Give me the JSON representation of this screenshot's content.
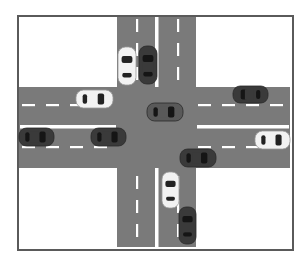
{
  "diagram": {
    "colors": {
      "road": "#7a7a7a",
      "lane_marking": "#ffffff",
      "frame": "#5a5a5a",
      "background": "#ffffff",
      "car_white": "#f2f2f2",
      "car_dark": "#3a3a3a",
      "car_mid": "#595959",
      "window": "#222222"
    },
    "frame": {
      "x": 17,
      "y": 15,
      "w": 275,
      "h": 234
    },
    "roads": {
      "horizontal": {
        "x": 19,
        "y": 87,
        "w": 271,
        "h": 81,
        "center_line_y": 127
      },
      "vertical": {
        "x": 117,
        "y": 17,
        "w": 79,
        "h": 230,
        "center_line_x": 157
      }
    },
    "cars": [
      {
        "id": "car-1",
        "color": "white",
        "orientation": "vertical",
        "facing": "up",
        "x": 118,
        "y": 47,
        "w": 18,
        "h": 38
      },
      {
        "id": "car-2",
        "color": "dark",
        "orientation": "vertical",
        "facing": "up",
        "x": 139,
        "y": 46,
        "w": 18,
        "h": 38
      },
      {
        "id": "car-3",
        "color": "white",
        "orientation": "horizontal",
        "facing": "right",
        "x": 76,
        "y": 90,
        "w": 37,
        "h": 18
      },
      {
        "id": "car-4",
        "color": "mid",
        "orientation": "horizontal",
        "facing": "right",
        "x": 147,
        "y": 103,
        "w": 36,
        "h": 18
      },
      {
        "id": "car-5",
        "color": "dark",
        "orientation": "horizontal",
        "facing": "left",
        "x": 233,
        "y": 86,
        "w": 35,
        "h": 17
      },
      {
        "id": "car-6",
        "color": "dark",
        "orientation": "horizontal",
        "facing": "right",
        "x": 19,
        "y": 128,
        "w": 35,
        "h": 18
      },
      {
        "id": "car-7",
        "color": "dark",
        "orientation": "horizontal",
        "facing": "right",
        "x": 91,
        "y": 128,
        "w": 35,
        "h": 18
      },
      {
        "id": "car-8",
        "color": "white",
        "orientation": "horizontal",
        "facing": "right",
        "x": 255,
        "y": 131,
        "w": 35,
        "h": 18
      },
      {
        "id": "car-9",
        "color": "dark",
        "orientation": "horizontal",
        "facing": "right",
        "x": 180,
        "y": 149,
        "w": 36,
        "h": 18
      },
      {
        "id": "car-10",
        "color": "white",
        "orientation": "vertical",
        "facing": "up",
        "x": 162,
        "y": 172,
        "w": 17,
        "h": 36
      },
      {
        "id": "car-11",
        "color": "dark",
        "orientation": "vertical",
        "facing": "up",
        "x": 179,
        "y": 207,
        "w": 17,
        "h": 37
      }
    ]
  }
}
